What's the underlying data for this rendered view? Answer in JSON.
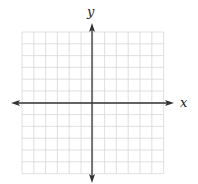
{
  "diagram": {
    "type": "coordinate-plane",
    "x_label": "x",
    "y_label": "y",
    "grid": {
      "cols": 12,
      "rows": 12,
      "left": 22,
      "top": 32,
      "cell": 11.8,
      "line_color": "#d8d8d8"
    },
    "axes": {
      "color": "#333333",
      "origin_x": 92,
      "origin_y": 103,
      "x_arrow_left": 11,
      "x_arrow_right": 174,
      "y_arrow_top": 23,
      "y_arrow_bottom": 183
    }
  }
}
